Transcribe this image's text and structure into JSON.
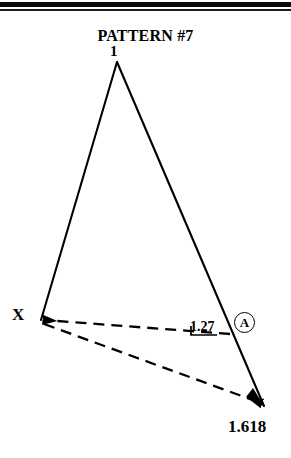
{
  "page": {
    "title": "PATTERN #7",
    "background_color": "#ffffff",
    "ink_color": "#000000"
  },
  "rules": {
    "thick_rule": "horizontal-rule-thick",
    "thin_rule": "horizontal-rule-thin"
  },
  "figure": {
    "type": "geometric-pattern-diagram",
    "points": {
      "apex": {
        "label": "1",
        "x": 117,
        "y": 62
      },
      "x_point": {
        "label": "X",
        "x": 41,
        "y": 320
      },
      "ratio_point": {
        "label": "1.27",
        "x": 228,
        "y": 331
      },
      "end_point": {
        "label": "1.618",
        "x": 264,
        "y": 406
      }
    },
    "labels": {
      "apex": "1",
      "x": "X",
      "ratio_127": "1.27",
      "ratio_1618": "1.618",
      "marker_a": "A"
    },
    "solid_lines": [
      {
        "name": "left-leg",
        "from": "apex",
        "to": "x_point"
      },
      {
        "name": "right-leg",
        "from": "apex",
        "to": "end_point"
      }
    ],
    "dashed_lines": [
      {
        "name": "dashed-leg-127",
        "from": "x_point",
        "to": "ratio_point"
      },
      {
        "name": "dashed-leg-1618",
        "from": "x_point",
        "to": "end_point"
      }
    ],
    "arrowheads": [
      {
        "name": "arrowhead-to-x",
        "at": "x_point"
      },
      {
        "name": "arrowhead-to-end",
        "at": "end_point"
      }
    ]
  }
}
